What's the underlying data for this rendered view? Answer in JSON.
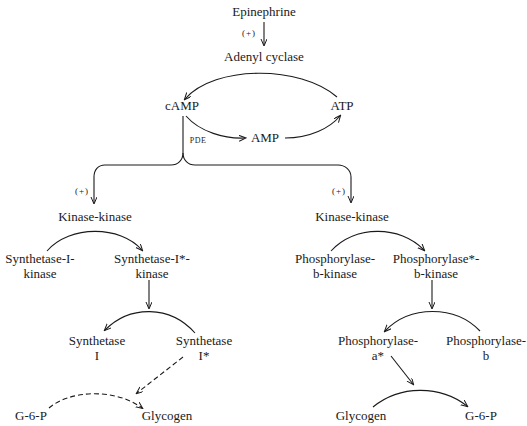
{
  "diagram": {
    "top": {
      "epinephrine": "Epinephrine",
      "plus1": "(+)",
      "adenyl_cyclase": "Adenyl cyclase",
      "camp": "cAMP",
      "atp": "ATP",
      "amp": "AMP",
      "pde": "PDE"
    },
    "left": {
      "plus": "(+)",
      "kinase_kinase": "Kinase-kinase",
      "synthetase_i_kinase": [
        "Synthetase-I-",
        "kinase"
      ],
      "synthetase_i_star_kinase": [
        "Synthetase-I*-",
        "kinase"
      ],
      "synthetase_i": [
        "Synthetase",
        "I"
      ],
      "synthetase_i_star": [
        "Synthetase",
        "I*"
      ],
      "g6p": "G-6-P",
      "glycogen": "Glycogen"
    },
    "right": {
      "plus": "(+)",
      "kinase_kinase": "Kinase-kinase",
      "phosphorylase_b_kinase": [
        "Phosphorylase-",
        "b-kinase"
      ],
      "phosphorylase_star_b_kinase": [
        "Phosphorylase*-",
        "b-kinase"
      ],
      "phosphorylase_a_star": [
        "Phosphorylase-",
        "a*"
      ],
      "phosphorylase_b": [
        "Phosphorylase-",
        "b"
      ],
      "glycogen": "Glycogen",
      "g6p": "G-6-P"
    },
    "colors": {
      "ink": "#1a1a1a",
      "background": "#ffffff"
    }
  }
}
